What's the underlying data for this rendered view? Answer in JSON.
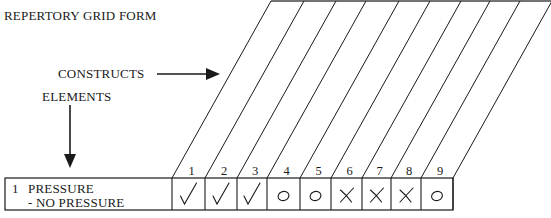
{
  "title": "REPERTORY GRID FORM",
  "labels": {
    "constructs": "CONSTRUCTS",
    "elements": "ELEMENTS"
  },
  "rows": [
    {
      "number": "1",
      "construct_pole_1": "PRESSURE",
      "construct_pole_2": "- NO PRESSURE",
      "ratings": [
        "check",
        "check",
        "check",
        "circle",
        "circle",
        "cross",
        "cross",
        "cross",
        "circle"
      ]
    }
  ],
  "columns": [
    "1",
    "2",
    "3",
    "4",
    "5",
    "6",
    "7",
    "8",
    "9"
  ],
  "icons": {
    "check": "✓",
    "circle": "O",
    "cross": "X",
    "arrow_right": "arrow-right-icon",
    "arrow_down": "arrow-down-icon"
  }
}
